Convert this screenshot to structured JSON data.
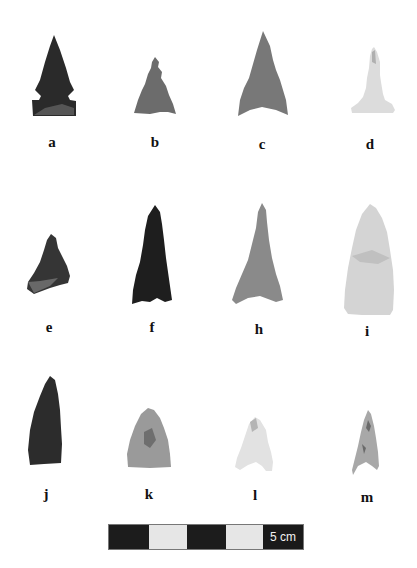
{
  "figure": {
    "specimens": [
      {
        "id": "a",
        "label": "a",
        "row": 1,
        "tone": "#2a2a2a"
      },
      {
        "id": "b",
        "label": "b",
        "row": 1,
        "tone": "#6c6c6c"
      },
      {
        "id": "c",
        "label": "c",
        "row": 1,
        "tone": "#787878"
      },
      {
        "id": "d",
        "label": "d",
        "row": 1,
        "tone": "#dcdcdc"
      },
      {
        "id": "e",
        "label": "e",
        "row": 2,
        "tone": "#353535"
      },
      {
        "id": "f",
        "label": "f",
        "row": 2,
        "tone": "#1e1e1e"
      },
      {
        "id": "h",
        "label": "h",
        "row": 2,
        "tone": "#8a8a8a"
      },
      {
        "id": "i",
        "label": "i",
        "row": 2,
        "tone": "#d4d4d4"
      },
      {
        "id": "j",
        "label": "j",
        "row": 3,
        "tone": "#2c2c2c"
      },
      {
        "id": "k",
        "label": "k",
        "row": 3,
        "tone": "#9a9a9a"
      },
      {
        "id": "l",
        "label": "l",
        "row": 3,
        "tone": "#e2e2e2"
      },
      {
        "id": "m",
        "label": "m",
        "row": 3,
        "tone": "#a8a8a8"
      }
    ],
    "scale_bar": {
      "label": "5 cm",
      "segments": [
        "dark",
        "light",
        "dark",
        "light"
      ]
    }
  }
}
